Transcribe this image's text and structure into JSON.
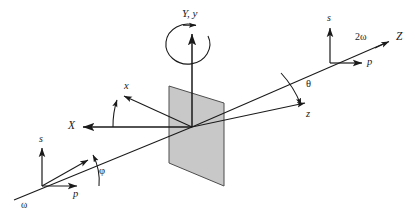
{
  "figure": {
    "background_color": "#ffffff",
    "line_color": "#1a1a1a",
    "plane_fill_color": "#c8c8c8",
    "plane_stroke_color": "#4d4d4d"
  },
  "labels": {
    "lab_y_axis": "Y, y",
    "lab_x_axis": "X",
    "lab_z_axis": "Z",
    "crystal_x_axis": "x",
    "crystal_z_axis": "z",
    "fundamental_frequency": "ω",
    "second_harmonic": "2ω",
    "incident_p_polarization": "p",
    "incident_s_polarization": "s",
    "outgoing_p_polarization": "p",
    "outgoing_s_polarization": "s",
    "azimuthal_angle": "φ",
    "polar_angle": "θ"
  },
  "geometry": {
    "origin": {
      "x": 192,
      "y": 127
    },
    "incident_beam_start": {
      "x": 14,
      "y": 200
    },
    "outgoing_beam_end": {
      "x": 392,
      "y": 40
    },
    "incident_origin": {
      "x": 42,
      "y": 186
    },
    "outgoing_origin": {
      "x": 330,
      "y": 63
    },
    "lab_x_arrow_tip": {
      "x": 85,
      "y": 127
    },
    "crystal_x_arrow_tip": {
      "x": 125,
      "y": 97
    },
    "crystal_z_arrow_tip": {
      "x": 308,
      "y": 105
    },
    "lab_y_arrow_tip": {
      "x": 192,
      "y": 31
    },
    "plane_points": "169,86 224,103 224,186 169,163"
  }
}
